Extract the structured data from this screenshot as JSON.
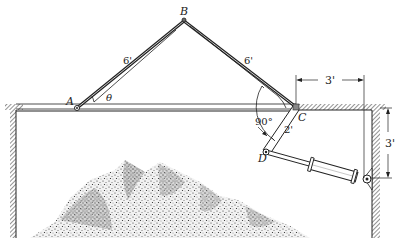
{
  "diagram": {
    "type": "mechanism",
    "points": {
      "A": "A",
      "B": "B",
      "C": "C",
      "D": "D"
    },
    "labels": {
      "AB_length": "6'",
      "BC_length": "6'",
      "CD_length": "2'",
      "horizontal_dim": "3'",
      "vertical_dim": "3'",
      "angle_theta": "θ",
      "right_angle": "90°"
    },
    "colors": {
      "line": "#222222",
      "hatch": "#555555",
      "background": "#ffffff"
    }
  }
}
